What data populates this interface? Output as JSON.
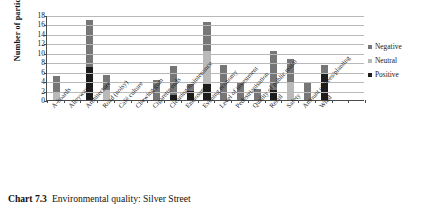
{
  "caption": {
    "number": "Chart 7.3",
    "text": "Environmental quality: Silver Street"
  },
  "legend": {
    "position": "right",
    "items": [
      {
        "label": "Negative",
        "color": "#767676"
      },
      {
        "label": "Neutral",
        "color": "#b9b9b9"
      },
      {
        "label": "Positive",
        "color": "#1c1c1c"
      }
    ]
  },
  "chart_data": {
    "type": "bar",
    "subtype": "stacked-vertical",
    "title": "",
    "xlabel": "",
    "ylabel": "Number of participants",
    "ylim": [
      0,
      18
    ],
    "yticks": [
      0,
      2,
      4,
      6,
      8,
      10,
      12,
      14,
      16,
      18
    ],
    "grid": true,
    "categories": [
      "A-boards",
      "Alleyways",
      "Architecture",
      "Road (noisy)",
      "Café culture",
      "Chewing gum",
      "Cigarette ends",
      "Cleaning/maintenance",
      "Enclosure",
      "Evening economy",
      "Level of investment",
      "Pedestrianisation",
      "Quality of public realm",
      "Retail",
      "Safety",
      "Amount of trees/planting",
      "Wind"
    ],
    "series": [
      {
        "name": "Positive",
        "color": "#1c1c1c",
        "values": [
          0,
          0,
          7,
          0,
          0,
          0,
          0,
          1,
          2,
          3.3,
          0,
          0,
          0,
          2.2,
          0,
          0,
          5.7
        ]
      },
      {
        "name": "Neutral",
        "color": "#b9b9b9",
        "values": [
          1.5,
          0,
          0,
          2.2,
          0,
          0,
          0,
          0,
          0,
          7,
          0,
          0,
          0,
          0,
          3.6,
          0,
          0
        ]
      },
      {
        "name": "Negative",
        "color": "#767676",
        "values": [
          3.5,
          0,
          10,
          3,
          0,
          0,
          4.3,
          6.2,
          1.3,
          6.2,
          7.4,
          3.5,
          2.4,
          8.2,
          5,
          3.6,
          1.8
        ]
      }
    ],
    "totals": [
      5,
      0,
      17,
      5.2,
      0,
      0,
      4.3,
      7.2,
      3.3,
      16.5,
      7.4,
      3.5,
      2.4,
      10.4,
      8.6,
      3.6,
      7.5
    ]
  }
}
